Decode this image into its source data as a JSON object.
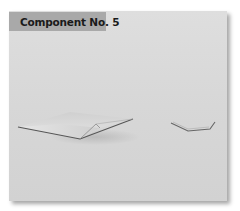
{
  "panel": {
    "label": "Component No. 5",
    "background": "#d8d8d8",
    "label_background": "#a9a9a9"
  },
  "shapes": [
    {
      "name": "large-folded-shape",
      "description": "flat folded paper-like shape"
    },
    {
      "name": "small-bent-line-shape",
      "description": "thin bent line shape"
    }
  ],
  "caption": {
    "text": ""
  }
}
